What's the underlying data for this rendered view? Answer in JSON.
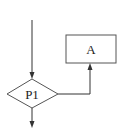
{
  "diagram": {
    "type": "flowchart",
    "nodes": [
      {
        "id": "P1",
        "shape": "diamond",
        "label": "P1"
      },
      {
        "id": "A",
        "shape": "rectangle",
        "label": "A"
      }
    ],
    "edges": [
      {
        "from": "entry",
        "to": "P1"
      },
      {
        "from": "P1",
        "to": "A",
        "exit": "right"
      },
      {
        "from": "P1",
        "to": "exit",
        "exit": "bottom"
      }
    ],
    "colors": {
      "stroke": "#333333",
      "background": "#ffffff"
    }
  }
}
